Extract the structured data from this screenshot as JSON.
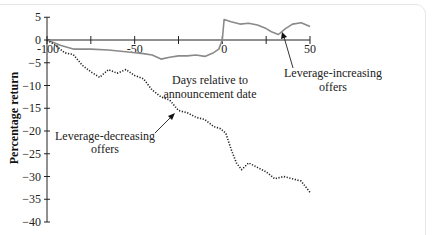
{
  "chart_data": {
    "type": "line",
    "title": "",
    "xlabel": "Days relative to announcement date",
    "ylabel": "Percentage return",
    "xlim": [
      -100,
      50
    ],
    "ylim": [
      -40,
      5
    ],
    "x_ticks": [
      -100,
      -75,
      -50,
      -25,
      0,
      25,
      50
    ],
    "x_tick_labels": [
      "-100",
      "-50",
      "0",
      "50"
    ],
    "y_ticks": [
      5,
      0,
      -5,
      -10,
      -15,
      -20,
      -25,
      -30,
      -35,
      -40
    ],
    "y_tick_labels": [
      "5",
      "0",
      "−5",
      "−10",
      "−15",
      "−20",
      "−25",
      "−30",
      "−35",
      "−40"
    ],
    "grid": false,
    "legend": "none (inline annotations)",
    "series": [
      {
        "name": "Leverage-increasing offers",
        "style": "solid gray",
        "color": "#8a8a8a",
        "x": [
          -100,
          -92,
          -85,
          -75,
          -65,
          -55,
          -50,
          -45,
          -40,
          -35,
          -30,
          -25,
          -20,
          -15,
          -10,
          -5,
          -2,
          0,
          1,
          5,
          10,
          15,
          20,
          25,
          28,
          32,
          36,
          40,
          45,
          50
        ],
        "y": [
          0,
          -1.2,
          -2,
          -2,
          -2.2,
          -2.6,
          -2.8,
          -3,
          -3.3,
          -4.2,
          -3.8,
          -3.5,
          -3.5,
          -3.3,
          -3.6,
          -2.8,
          -2,
          0,
          4.5,
          4,
          3.5,
          3.7,
          3.3,
          2.5,
          1.8,
          1.2,
          2.5,
          3.5,
          3.8,
          3
        ]
      },
      {
        "name": "Leverage-decreasing offers",
        "style": "dotted black",
        "color": "#222222",
        "x": [
          -100,
          -95,
          -90,
          -85,
          -80,
          -75,
          -70,
          -65,
          -60,
          -55,
          -50,
          -45,
          -40,
          -35,
          -30,
          -25,
          -20,
          -15,
          -10,
          -5,
          -1,
          2,
          5,
          8,
          11,
          15,
          20,
          25,
          30,
          35,
          40,
          45,
          50
        ],
        "y": [
          0,
          -1.2,
          -2.8,
          -3.2,
          -5.5,
          -7,
          -8.2,
          -6.5,
          -7.3,
          -6.5,
          -7.8,
          -8.5,
          -11,
          -12.5,
          -13.2,
          -15.5,
          -16,
          -17,
          -17.5,
          -19,
          -19.5,
          -20.5,
          -24,
          -27,
          -28.5,
          -27,
          -28,
          -29,
          -30.5,
          -30,
          -30.5,
          -31,
          -33.5
        ]
      }
    ],
    "annotations": [
      {
        "text_lines": [
          "Leverage-increasing",
          "offers"
        ],
        "points_to": "Leverage-increasing series near day 30"
      },
      {
        "text_lines": [
          "Leverage-decreasing",
          "offers"
        ],
        "points_to": "Leverage-decreasing series near day -25"
      },
      {
        "text_lines": [
          "Days relative to",
          "announcement date"
        ],
        "role": "x-axis title"
      }
    ]
  },
  "labels": {
    "ylabel": "Percentage return",
    "xlabel_line1": "Days relative to",
    "xlabel_line2": "announcement date",
    "inc_line1": "Leverage-increasing",
    "inc_line2": "offers",
    "dec_line1": "Leverage-decreasing",
    "dec_line2": "offers"
  }
}
